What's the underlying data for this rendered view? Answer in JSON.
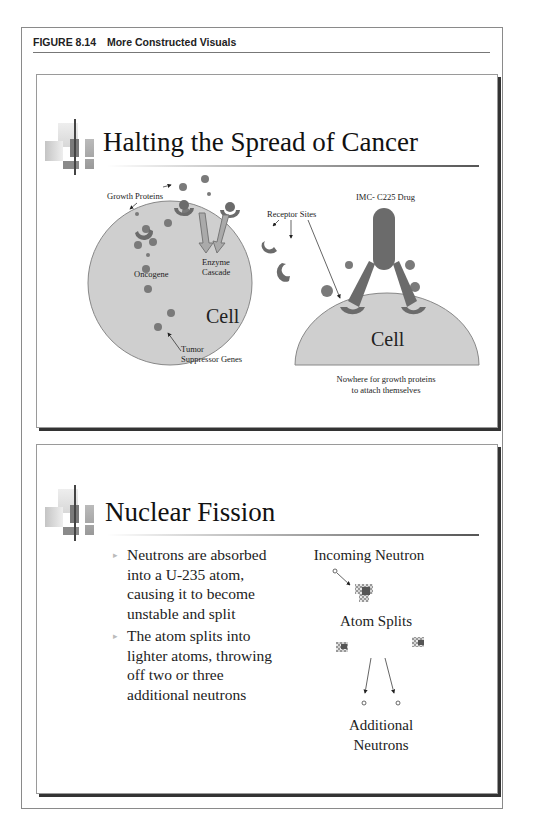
{
  "figure": {
    "number": "FIGURE 8.14",
    "title": "More Constructed Visuals"
  },
  "slides": [
    {
      "title": "Halting the Spread of Cancer",
      "labels": {
        "growth_proteins": "Growth Proteins",
        "receptor_sites": "Receptor Sites",
        "drug": "IMC- C225 Drug",
        "enzyme_cascade_1": "Enzyme",
        "enzyme_cascade_2": "Cascade",
        "oncogene": "Oncogene",
        "cell_left": "Cell",
        "tumor_1": "Tumor",
        "tumor_2": "Suppressor Genes",
        "cell_right": "Cell",
        "caption_1": "Nowhere for growth proteins",
        "caption_2": "to attach themselves"
      },
      "colors": {
        "cell_fill": "#cfcfcf",
        "protein": "#7a7a7a",
        "receptor": "#6b6b6b"
      }
    },
    {
      "title": "Nuclear Fission",
      "bullets": [
        "Neutrons are absorbed into a U-235 atom, causing it to become unstable and split",
        "The atom splits into lighter atoms, throwing off two or three additional neutrons"
      ],
      "labels": {
        "incoming": "Incoming Neutron",
        "splits": "Atom Splits",
        "additional_1": "Additional",
        "additional_2": "Neutrons"
      }
    }
  ]
}
